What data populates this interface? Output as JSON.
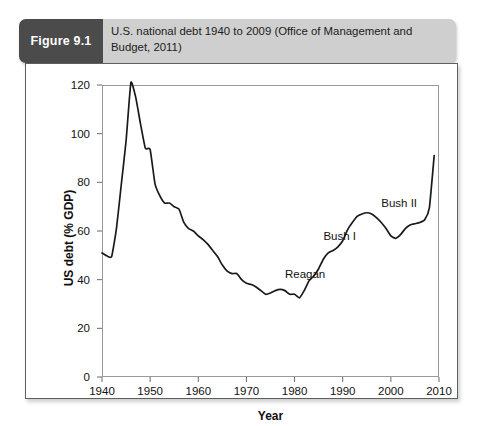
{
  "figure": {
    "badge_label": "Figure 9.1",
    "caption": "U.S. national debt 1940 to 2009 (Office of Management and Budget, 2011)",
    "badge_bg": "#4b4b4b",
    "header_bg": "#cfcfcf",
    "line_color": "#1a1a1a",
    "frame_color": "#9a9a9a"
  },
  "chart_data": {
    "type": "line",
    "title": "U.S. national debt 1940 to 2009 (Office of Management and Budget, 2011)",
    "xlabel": "Year",
    "ylabel": "US debt (% GDP)",
    "xlim": [
      1940,
      2010
    ],
    "ylim": [
      0,
      120
    ],
    "xticks": [
      1940,
      1950,
      1960,
      1970,
      1980,
      1990,
      2000,
      2010
    ],
    "xtick_labels": [
      "1940",
      "1950",
      "1960",
      "1970",
      "1980",
      "1990",
      "2000",
      "2010"
    ],
    "yticks": [
      0,
      20,
      40,
      60,
      80,
      100,
      120
    ],
    "ytick_labels": [
      "0",
      "20",
      "40",
      "60",
      "80",
      "100",
      "120"
    ],
    "grid": false,
    "legend": "none",
    "series": [
      {
        "name": "US debt (% GDP)",
        "x": [
          1940,
          1941,
          1942,
          1943,
          1944,
          1945,
          1946,
          1947,
          1948,
          1949,
          1950,
          1951,
          1952,
          1953,
          1954,
          1955,
          1956,
          1957,
          1958,
          1959,
          1960,
          1961,
          1962,
          1963,
          1964,
          1965,
          1966,
          1967,
          1968,
          1969,
          1970,
          1971,
          1972,
          1973,
          1974,
          1975,
          1976,
          1977,
          1978,
          1979,
          1980,
          1981,
          1982,
          1983,
          1984,
          1985,
          1986,
          1987,
          1988,
          1989,
          1990,
          1991,
          1992,
          1993,
          1994,
          1995,
          1996,
          1997,
          1998,
          1999,
          2000,
          2001,
          2002,
          2003,
          2004,
          2005,
          2006,
          2007,
          2008,
          2009
        ],
        "values": [
          51.0,
          49.8,
          49.5,
          61.0,
          79.0,
          97.0,
          121.0,
          115.0,
          104.0,
          94.0,
          93.5,
          79.5,
          74.5,
          71.5,
          71.5,
          70.0,
          69.0,
          63.5,
          61.0,
          60.0,
          58.0,
          56.5,
          54.5,
          52.0,
          49.5,
          46.0,
          43.5,
          42.5,
          42.5,
          40.0,
          38.5,
          38.0,
          37.0,
          35.5,
          34.0,
          34.5,
          35.5,
          36.0,
          35.5,
          34.0,
          34.0,
          32.5,
          35.5,
          39.5,
          41.5,
          44.5,
          48.5,
          51.0,
          52.0,
          53.5,
          56.0,
          60.5,
          63.5,
          66.0,
          67.0,
          67.5,
          67.0,
          65.5,
          63.5,
          61.0,
          58.0,
          57.0,
          58.5,
          61.0,
          62.5,
          63.0,
          63.5,
          64.5,
          69.5,
          91.0
        ]
      }
    ],
    "annotations": [
      {
        "text": "Reagan",
        "year": 1978,
        "value": 42.0
      },
      {
        "text": "Bush I",
        "year": 1986,
        "value": 57.5
      },
      {
        "text": "Bush II",
        "year": 1998,
        "value": 71.0
      }
    ]
  }
}
